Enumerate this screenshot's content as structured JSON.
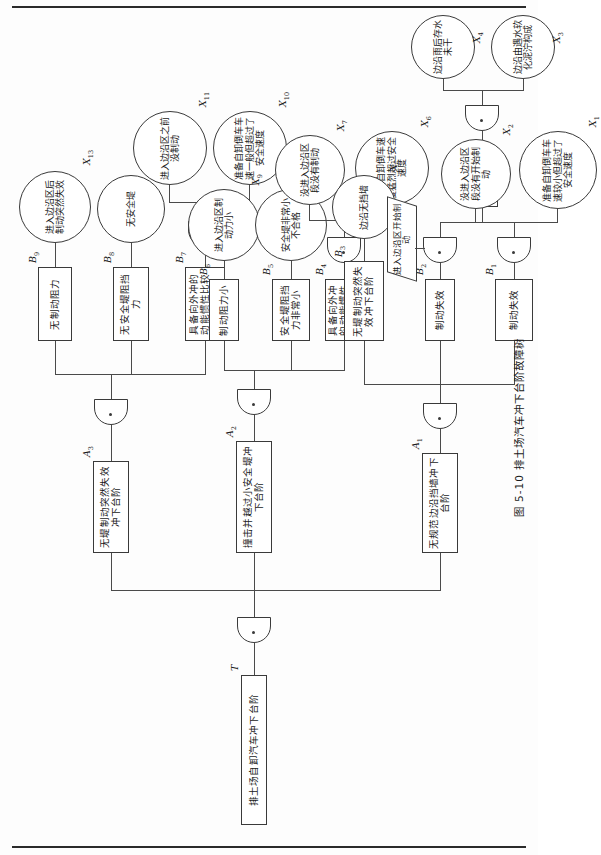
{
  "figure": {
    "caption": "图 5-10  排土场汽车冲下台阶故障树",
    "rotation_note": "90"
  },
  "top_event": {
    "id": "T",
    "label": "排土场自卸汽车冲下台阶"
  },
  "gates": {
    "g_top": "or-gate",
    "g_a1": "or-gate",
    "g_a2": "or-gate",
    "g_a3": "or-gate",
    "g_b1": "and-gate",
    "g_b2": "and-gate",
    "g_b4": "and-gate",
    "g_b7": "and-gate"
  },
  "intermediate_events": [
    {
      "id": "A1",
      "label": "无规范边沿挡墙冲下台阶"
    },
    {
      "id": "A2",
      "label": "撞击并越过小安全堤冲下台阶"
    },
    {
      "id": "A3",
      "label": "无堤制动突然失效冲下台阶"
    },
    {
      "id": "B1",
      "label": "具备向外冲的动能惯性较小"
    },
    {
      "id": "B2",
      "label": "制动失效"
    },
    {
      "id": "B3",
      "label": "边沿无挡墙力，保持向外冲力惯性"
    },
    {
      "id": "B4",
      "label": "具备向外冲的动能惯性较大"
    },
    {
      "id": "B5",
      "label": "安全堤阻挡力非常小"
    },
    {
      "id": "B6",
      "label": "制动阻力小"
    },
    {
      "id": "B7",
      "label": "具备向外冲的动能惯性比较一般"
    },
    {
      "id": "B8",
      "label": "无安全堤阻挡力"
    },
    {
      "id": "B9",
      "label": "无制动阻力"
    }
  ],
  "basic_events": [
    {
      "id": "X1",
      "label": "准备自卸倒车车速较小但超过了安全速度"
    },
    {
      "id": "X2",
      "label": "没进入边沿区段没有开始制动"
    },
    {
      "id": "X3",
      "label": "边沿由遇水软化泥泞构成"
    },
    {
      "id": "X4",
      "label": "边沿雨后存水未干"
    },
    {
      "id": "X5",
      "label": "边沿无挡墙"
    },
    {
      "id": "X6",
      "label": "准备自卸倒车速度猛烈超过安全速度"
    },
    {
      "id": "X7",
      "label": "没进入边沿区段没有制动"
    },
    {
      "id": "X8",
      "label": "安全堤非常小不合格"
    },
    {
      "id": "X9",
      "label": "进入边沿区制动力小"
    },
    {
      "id": "X10",
      "label": "准备自卸倒车车速一般但超过了安全速度"
    },
    {
      "id": "X11",
      "label": "进入边沿区之前没制动"
    },
    {
      "id": "X12",
      "label": "无安全堤"
    },
    {
      "id": "X13",
      "label": "进入边沿区后制动突然失效"
    }
  ],
  "conditions": [
    {
      "id": "C1",
      "label": "进入边沿区开始制动"
    },
    {
      "id": "C2",
      "label": "车轮具备打滑条件"
    }
  ],
  "colors": {
    "stroke": "#3a3a3a",
    "line": "#4a4a4a",
    "paper": "#fdfdfd",
    "ink": "#1a1a1a"
  }
}
